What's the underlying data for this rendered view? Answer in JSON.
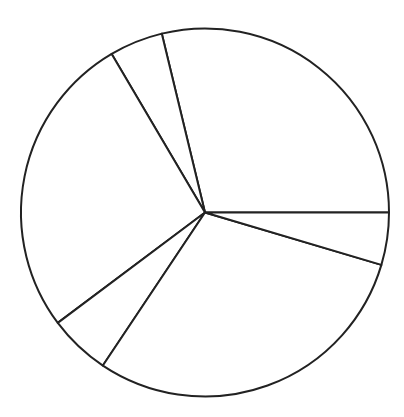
{
  "chart_data": {
    "type": "pie",
    "title": "",
    "labels": [
      "",
      "",
      "",
      "",
      "",
      ""
    ],
    "values": [
      28.8,
      4.7,
      26.8,
      5.4,
      29.8,
      4.6
    ],
    "start_angle_deg": 0,
    "direction": "counterclockwise",
    "legend": "none",
    "colors": {
      "fill": "#ffffff",
      "stroke": "#222222"
    }
  },
  "geometry": {
    "cx": 205,
    "cy": 212.5,
    "r": 184
  }
}
